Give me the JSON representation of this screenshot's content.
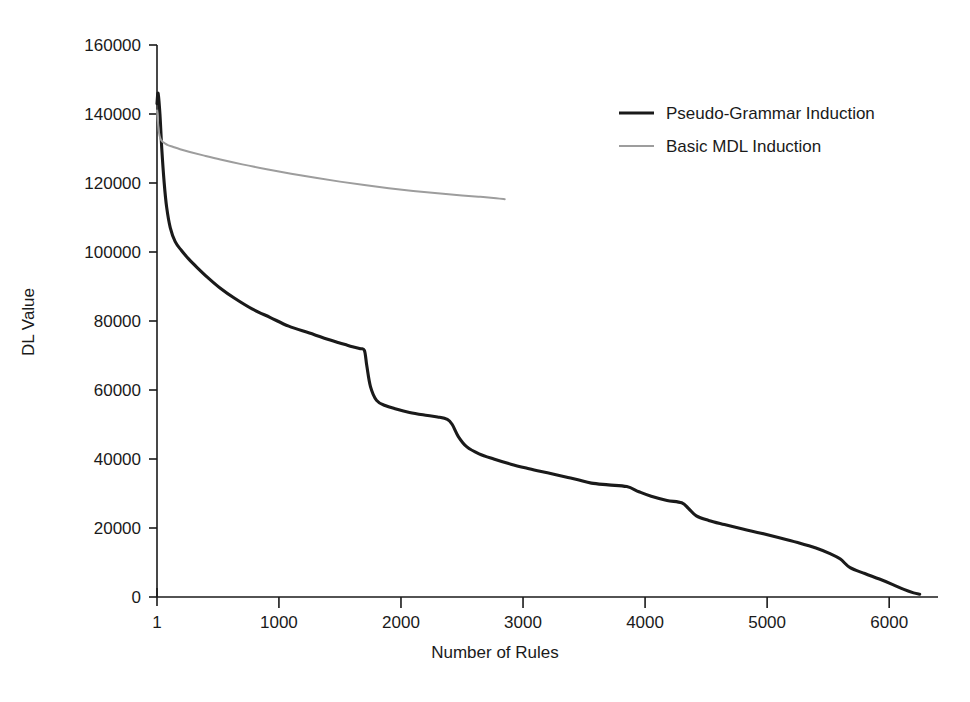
{
  "chart_data": {
    "type": "line",
    "title": "",
    "xlabel": "Number of Rules",
    "ylabel": "DL Value",
    "xlim": [
      1,
      6400
    ],
    "ylim": [
      0,
      160000
    ],
    "xticks": [
      1,
      1000,
      2000,
      3000,
      4000,
      5000,
      6000
    ],
    "xtick_labels": [
      "1",
      "1000",
      "2000",
      "3000",
      "4000",
      "5000",
      "6000"
    ],
    "yticks": [
      0,
      20000,
      40000,
      60000,
      80000,
      100000,
      120000,
      140000,
      160000
    ],
    "ytick_labels": [
      "0",
      "20000",
      "40000",
      "60000",
      "80000",
      "100000",
      "120000",
      "140000",
      "160000"
    ],
    "grid": false,
    "legend_position": "top-right",
    "series": [
      {
        "name": "Pseudo-Grammar Induction",
        "color": "#1a1a1a",
        "line_width": 3.1,
        "x": [
          1,
          10,
          25,
          40,
          60,
          80,
          110,
          150,
          200,
          260,
          330,
          420,
          520,
          640,
          780,
          930,
          1080,
          1250,
          1420,
          1560,
          1660,
          1700,
          1720,
          1750,
          1800,
          1870,
          1960,
          2070,
          2180,
          2300,
          2380,
          2420,
          2470,
          2540,
          2640,
          2760,
          2900,
          3050,
          3200,
          3350,
          3450,
          3560,
          3700,
          3850,
          3950,
          4050,
          4180,
          4300,
          4360,
          4420,
          4520,
          4650,
          4800,
          4950,
          5100,
          5250,
          5400,
          5520,
          5600,
          5680,
          5800,
          5920,
          6030,
          6120,
          6200,
          6250
        ],
        "y": [
          143000,
          146000,
          140000,
          130000,
          120000,
          113000,
          107000,
          103000,
          100500,
          98000,
          95500,
          92500,
          89500,
          86500,
          83500,
          81000,
          78500,
          76500,
          74500,
          73000,
          72000,
          71500,
          67000,
          61000,
          57000,
          55500,
          54500,
          53500,
          52800,
          52200,
          51500,
          50000,
          46500,
          43500,
          41500,
          40000,
          38500,
          37200,
          36000,
          34800,
          34000,
          33000,
          32500,
          32000,
          30500,
          29200,
          28000,
          27300,
          25500,
          23500,
          22200,
          21000,
          19700,
          18500,
          17200,
          15800,
          14200,
          12500,
          11000,
          8500,
          6800,
          5200,
          3600,
          2200,
          1200,
          800
        ]
      },
      {
        "name": "Basic MDL Induction",
        "color": "#9d9d9d",
        "line_width": 2.0,
        "x": [
          1,
          8,
          18,
          30,
          45,
          65,
          90,
          130,
          190,
          270,
          380,
          520,
          700,
          900,
          1100,
          1300,
          1500,
          1700,
          1900,
          2100,
          2300,
          2500,
          2650,
          2780,
          2850
        ],
        "y": [
          141000,
          138000,
          134500,
          132800,
          132000,
          131500,
          131000,
          130500,
          129800,
          129000,
          128000,
          126800,
          125400,
          124000,
          122700,
          121500,
          120400,
          119400,
          118500,
          117700,
          117000,
          116400,
          116000,
          115600,
          115300
        ]
      }
    ]
  },
  "legend": {
    "entries": [
      {
        "label": "Pseudo-Grammar Induction"
      },
      {
        "label": "Basic MDL Induction"
      }
    ]
  },
  "axes": {
    "x_title": "Number of Rules",
    "y_title": "DL Value"
  }
}
